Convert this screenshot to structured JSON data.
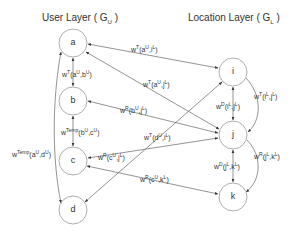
{
  "titles": {
    "user_layer": "User Layer ( G",
    "user_layer_sub": "U",
    "user_layer_end": " )",
    "location_layer": "Location Layer ( G",
    "location_layer_sub": "L",
    "location_layer_end": " )"
  },
  "nodes": {
    "a": "a",
    "b": "b",
    "c": "c",
    "d": "d",
    "i": "i",
    "j": "j",
    "k": "k"
  },
  "edges": {
    "a_i": {
      "w": "w",
      "sup": "T",
      "text": "(a",
      "s1": "U",
      "mid": ",i",
      "s2": "L",
      "end": ")"
    },
    "a_j": {
      "w": "w",
      "sup": "T",
      "text": "(a",
      "s1": "U",
      "mid": ",j",
      "s2": "L",
      "end": ")"
    },
    "a_b": {
      "w": "w",
      "sup": "T",
      "text": "(a",
      "s1": "U",
      "mid": ",b",
      "s2": "U",
      "end": ")"
    },
    "b_j": {
      "w": "w",
      "sup": "R",
      "text": "(b",
      "s1": "U",
      "mid": ",j",
      "s2": "L",
      "end": ")"
    },
    "b_c": {
      "w": "w",
      "sup": "Temp",
      "text": "(b",
      "s1": "U",
      "mid": ",c",
      "s2": "U",
      "end": ")"
    },
    "a_d": {
      "w": "w",
      "sup": "Temp",
      "text": "(a",
      "s1": "U",
      "mid": ",d",
      "s2": "U",
      "end": ")"
    },
    "c_j": {
      "w": "w",
      "sup": "R",
      "text": "(c",
      "s1": "U",
      "mid": ",j",
      "s2": "L",
      "end": ")"
    },
    "c_k": {
      "w": "w",
      "sup": "R",
      "text": "(c",
      "s1": "U",
      "mid": ",k",
      "s2": "L",
      "end": ")"
    },
    "d_i": {
      "w": "w",
      "sup": "T",
      "text": "(d",
      "s1": "U",
      "mid": ",i",
      "s2": "L",
      "end": ")"
    },
    "i_j_d": {
      "w": "w",
      "sup": "D",
      "text": "(i",
      "s1": "L",
      "mid": ",j",
      "s2": "L",
      "end": ")"
    },
    "i_j_t": {
      "w": "w",
      "sup": "T",
      "text": "(i",
      "s1": "L",
      "mid": ",j",
      "s2": "L",
      "end": ")"
    },
    "j_k_d": {
      "w": "w",
      "sup": "D",
      "text": "(j",
      "s1": "L",
      "mid": ",k",
      "s2": "L",
      "end": ")"
    },
    "j_k_r": {
      "w": "w",
      "sup": "R",
      "text": "(j",
      "s1": "L",
      "mid": ",k",
      "s2": "L",
      "end": ")"
    }
  },
  "colors": {
    "line": "#555555",
    "node_stroke": "#888888",
    "text": "#333333"
  }
}
